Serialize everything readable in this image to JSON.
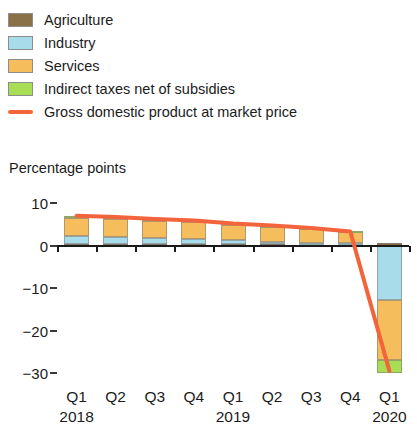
{
  "legend": {
    "items": [
      {
        "label": "Agriculture",
        "color": "#8a7148",
        "icon": "legend-swatch"
      },
      {
        "label": "Industry",
        "color": "#a8dceb",
        "icon": "legend-swatch"
      },
      {
        "label": "Services",
        "color": "#f6bd5c",
        "icon": "legend-swatch"
      },
      {
        "label": "Indirect taxes net of subsidies",
        "color": "#a8dd56",
        "icon": "legend-swatch"
      },
      {
        "label": "Gross domestic product at market price",
        "color": "#f4643c",
        "icon": "legend-line"
      }
    ]
  },
  "axis": {
    "y_title": "Percentage points",
    "y_ticks": [
      "10",
      "0",
      "−10",
      "−20",
      "−30"
    ],
    "y_values": [
      10,
      0,
      -10,
      -20,
      -30
    ]
  },
  "chart_data": {
    "type": "bar",
    "title": "",
    "subtitle": "",
    "xlabel": "",
    "ylabel": "Percentage points",
    "ylim": [
      -32,
      12
    ],
    "grid": false,
    "legend_position": "top-left",
    "stacked": true,
    "categories": [
      "Q1",
      "Q2",
      "Q3",
      "Q4",
      "Q1",
      "Q2",
      "Q3",
      "Q4",
      "Q1"
    ],
    "group_labels": [
      "2018",
      "2019",
      "2020"
    ],
    "group_spans": [
      4,
      4,
      1
    ],
    "series": [
      {
        "name": "Agriculture",
        "color": "#8a7148",
        "values": [
          0.3,
          0.3,
          0.3,
          0.3,
          0.3,
          0.3,
          0.3,
          0.4,
          0.5
        ]
      },
      {
        "name": "Industry",
        "color": "#a8dceb",
        "values": [
          2.0,
          1.8,
          1.5,
          1.3,
          0.9,
          0.6,
          0.4,
          0.2,
          -12.8
        ]
      },
      {
        "name": "Services",
        "color": "#f6bd5c",
        "values": [
          4.2,
          4.1,
          4.0,
          3.9,
          3.7,
          3.5,
          3.1,
          2.5,
          -14.2
        ]
      },
      {
        "name": "Indirect taxes net of subsidies",
        "color": "#a8dd56",
        "values": [
          0.5,
          0.5,
          0.4,
          0.4,
          0.3,
          0.3,
          0.3,
          0.2,
          -3.0
        ]
      }
    ],
    "line_series": {
      "name": "Gross domestic product at market price",
      "color": "#f4643c",
      "values": [
        7.0,
        6.7,
        6.2,
        5.9,
        5.2,
        4.7,
        4.1,
        3.3,
        -29.5
      ]
    }
  }
}
